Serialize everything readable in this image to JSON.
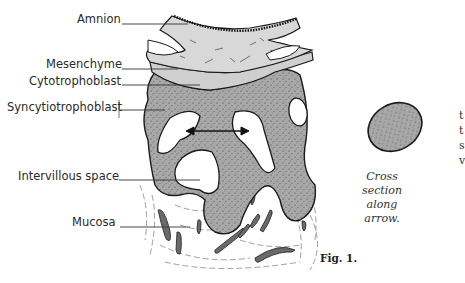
{
  "labels": {
    "amnion": "Amnion",
    "mesenchyme": "Mesenchyme",
    "cytotrophoblast": "Cytotrophoblast",
    "syncytiotrophoblast": "Syncytiotrophoblast",
    "intervillous_space": "Intervillous space",
    "mucosa": "Mucosa"
  },
  "caption": {
    "line1": "Cross",
    "line2": "section",
    "line3": "along",
    "line4": "arrow."
  },
  "figure_label": "Fig. 1.",
  "edge_fragments": [
    "t",
    "t",
    "s",
    "v"
  ],
  "colors": {
    "stippled_tissue": "#a9a9a9",
    "mesenchyme_fill": "#d6d6d6",
    "cytotrophoblast_fill": "#cfcfcf",
    "outline": "#1a1a1a",
    "mucosa_vessel": "#6a6a6a",
    "background": "#ffffff"
  }
}
